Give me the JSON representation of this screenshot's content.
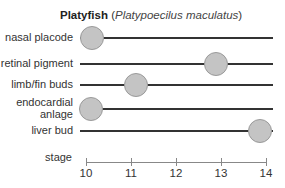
{
  "chart_data": {
    "type": "scatter",
    "title": "Platyfish",
    "subtitle": "Platypoecilus maculatus",
    "xlabel": "stage",
    "xlim": [
      10,
      14
    ],
    "xticks": [
      "10",
      "11",
      "12",
      "13",
      "14"
    ],
    "categories": [
      "nasal placode",
      "retinal pigment",
      "limb/fin buds",
      "endocardial anlage",
      "liver bud"
    ],
    "values": [
      10.1,
      12.9,
      11.1,
      10.1,
      13.9
    ],
    "grid": false,
    "legend": null
  },
  "rows": [
    {
      "label": "nasal placode",
      "label2": "",
      "y": 37,
      "x": 92
    },
    {
      "label": "retinal pigment",
      "label2": "",
      "y": 63,
      "x": 216
    },
    {
      "label": "limb/fin buds",
      "label2": "",
      "y": 84,
      "x": 136
    },
    {
      "label": "endocardial",
      "label2": "anlage",
      "y": 108,
      "x": 91
    },
    {
      "label": "liver bud",
      "label2": "",
      "y": 130,
      "x": 260
    }
  ]
}
